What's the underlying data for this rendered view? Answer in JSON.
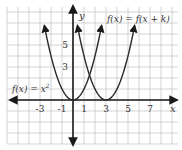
{
  "chart_data": {
    "type": "line",
    "title": "",
    "xlabel": "x",
    "ylabel": "y",
    "xlim": [
      -6,
      9
    ],
    "ylim": [
      -4,
      8
    ],
    "grid": true,
    "x_ticks": [
      -3,
      -1,
      1,
      3,
      5,
      7
    ],
    "x_tick_labels": [
      "-3",
      "-1",
      "1",
      "3",
      "5",
      "7"
    ],
    "y_ticks": [
      3,
      5
    ],
    "y_tick_labels": [
      "3",
      "5"
    ],
    "series": [
      {
        "name": "f(x) = x^2",
        "label": "f(x) = x",
        "label_superscript": "2",
        "function": "x^2",
        "vertex": [
          0,
          0
        ],
        "x_range": [
          -2.6,
          2.6
        ]
      },
      {
        "name": "f(x) = f(x + k)",
        "label": "f(x) = f(x + k)",
        "function": "(x-3)^2",
        "vertex": [
          3,
          0
        ],
        "x_range": [
          0.4,
          5.6
        ]
      }
    ],
    "annotations": [
      {
        "text": "f(x) = x^2",
        "near": "left parabola"
      },
      {
        "text": "f(x) = f(x + k)",
        "near": "right parabola"
      }
    ],
    "colors": {
      "curve": "#2a2a2a",
      "axis": "#1a1a1a",
      "grid": "#c8c8c8",
      "text": "#333333"
    }
  },
  "labels": {
    "x_axis": "x",
    "y_axis": "y",
    "left_curve": "f(x) = x",
    "left_curve_sup": "2",
    "right_curve": "f(x) = f(x + k)",
    "tick_x": [
      "-3",
      "-1",
      "1",
      "3",
      "5",
      "7"
    ],
    "tick_y": [
      "5",
      "3"
    ]
  }
}
